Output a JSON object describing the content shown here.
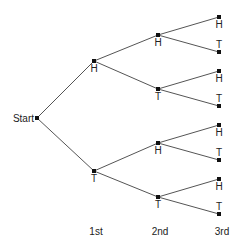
{
  "colors": {
    "edge": "#555555",
    "node": "#111111",
    "text": "#222222",
    "background": "#ffffff"
  },
  "root": {
    "label": "Start",
    "x": 37,
    "y": 118
  },
  "levels": [
    {
      "label": "1st",
      "x": 96,
      "y": 235
    },
    {
      "label": "2nd",
      "x": 160,
      "y": 235
    },
    {
      "label": "3rd",
      "x": 222,
      "y": 235
    }
  ],
  "nodes": [
    {
      "id": "H",
      "label": "H",
      "level": 1,
      "x": 94,
      "y": 61,
      "parent": "root",
      "label_pos": "below"
    },
    {
      "id": "T",
      "label": "T",
      "level": 1,
      "x": 94,
      "y": 171,
      "parent": "root",
      "label_pos": "below"
    },
    {
      "id": "HH",
      "label": "H",
      "level": 2,
      "x": 158,
      "y": 35,
      "parent": "H",
      "label_pos": "below"
    },
    {
      "id": "HT",
      "label": "T",
      "level": 2,
      "x": 158,
      "y": 89,
      "parent": "H",
      "label_pos": "below"
    },
    {
      "id": "TH",
      "label": "H",
      "level": 2,
      "x": 158,
      "y": 143,
      "parent": "T",
      "label_pos": "below"
    },
    {
      "id": "TT",
      "label": "T",
      "level": 2,
      "x": 158,
      "y": 197,
      "parent": "T",
      "label_pos": "below"
    },
    {
      "id": "HHH",
      "label": "H",
      "level": 3,
      "x": 219,
      "y": 17,
      "parent": "HH",
      "label_pos": "below"
    },
    {
      "id": "HHT",
      "label": "T",
      "level": 3,
      "x": 219,
      "y": 52,
      "parent": "HH",
      "label_pos": "above"
    },
    {
      "id": "HTH",
      "label": "H",
      "level": 3,
      "x": 219,
      "y": 71,
      "parent": "HT",
      "label_pos": "below"
    },
    {
      "id": "HTT",
      "label": "T",
      "level": 3,
      "x": 219,
      "y": 106,
      "parent": "HT",
      "label_pos": "above"
    },
    {
      "id": "THH",
      "label": "H",
      "level": 3,
      "x": 219,
      "y": 125,
      "parent": "TH",
      "label_pos": "below"
    },
    {
      "id": "THT",
      "label": "T",
      "level": 3,
      "x": 219,
      "y": 160,
      "parent": "TH",
      "label_pos": "above"
    },
    {
      "id": "TTH",
      "label": "H",
      "level": 3,
      "x": 219,
      "y": 179,
      "parent": "TT",
      "label_pos": "below"
    },
    {
      "id": "TTT",
      "label": "T",
      "level": 3,
      "x": 219,
      "y": 214,
      "parent": "TT",
      "label_pos": "above"
    }
  ]
}
